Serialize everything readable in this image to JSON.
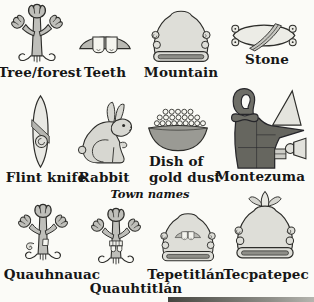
{
  "figure": {
    "type": "illustrated-glyph-glossary",
    "background_color": "#fbfbf7",
    "outline_color": "#2d2d2a",
    "label_color": "#161616"
  },
  "glyph_items": [
    {
      "name": "tree-forest",
      "label": "Tree/forest",
      "icon": "aztec-tree-glyph"
    },
    {
      "name": "teeth",
      "label": "Teeth",
      "icon": "aztec-teeth-glyph"
    },
    {
      "name": "mountain",
      "label": "Mountain",
      "icon": "aztec-mountain-glyph"
    },
    {
      "name": "stone",
      "label": "Stone",
      "icon": "aztec-stone-glyph"
    },
    {
      "name": "flint-knife",
      "label": "Flint knife",
      "icon": "aztec-flint-knife-glyph"
    },
    {
      "name": "rabbit",
      "label": "Rabbit",
      "icon": "aztec-rabbit-glyph"
    },
    {
      "name": "dish-of-gold-dust",
      "label_lines": [
        "Dish of",
        "gold dust"
      ],
      "icon": "aztec-dish-of-gold-dust-glyph"
    },
    {
      "name": "montezuma",
      "label": "Montezuma",
      "icon": "aztec-montezuma-crown-glyph"
    }
  ],
  "town_section": {
    "header": "Town names",
    "towns": [
      {
        "name": "quauhnauac",
        "label": "Quauhnauac",
        "icon": "tree-with-speech-scroll-glyph"
      },
      {
        "name": "quauhtitlan",
        "label": "Quauhtitlán",
        "icon": "tree-with-teeth-glyph"
      },
      {
        "name": "tepetitlan",
        "label": "Tepetitlán",
        "icon": "mountain-with-teeth-glyph"
      },
      {
        "name": "tecpatepec",
        "label": "Tecpatepec",
        "icon": "mountain-with-flint-glyph"
      }
    ]
  }
}
